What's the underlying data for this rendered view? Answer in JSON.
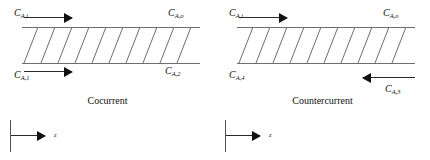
{
  "figure": {
    "background_color": "#ffffff",
    "line_color": "#6d6d6d",
    "arrow_color": "#111111",
    "axis_label": "z"
  },
  "panels": [
    {
      "id": "cocurrent",
      "caption": "Cocurrent",
      "labels": {
        "top_left": {
          "base": "C",
          "sub": "A,i"
        },
        "top_right": {
          "base": "C",
          "sub": "A,o"
        },
        "bottom_left": {
          "base": "C",
          "sub": "A,1"
        },
        "bottom_right": {
          "base": "C",
          "sub": "A,2"
        }
      },
      "flows": {
        "top_direction": "right",
        "bottom_direction": "right"
      },
      "hatch_count": 10,
      "axis_label": "z"
    },
    {
      "id": "countercurrent",
      "caption": "Countercurrent",
      "labels": {
        "top_left": {
          "base": "C",
          "sub": "A,i"
        },
        "top_right": {
          "base": "C",
          "sub": "A,o"
        },
        "bottom_left": {
          "base": "C",
          "sub": "A,4"
        },
        "bottom_right": {
          "base": "C",
          "sub": "A,3"
        }
      },
      "flows": {
        "top_direction": "right",
        "bottom_direction": "left"
      },
      "hatch_count": 10,
      "axis_label": "z"
    }
  ]
}
